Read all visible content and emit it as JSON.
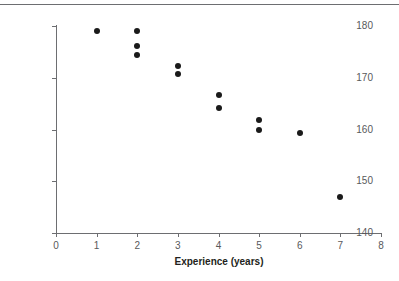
{
  "chart_data": {
    "type": "scatter",
    "title": "",
    "xlabel": "Experience (years)",
    "ylabel": "Preparation time (seconds)",
    "xlim": [
      0,
      8
    ],
    "ylim": [
      140,
      180
    ],
    "xticks": [
      "0",
      "1",
      "2",
      "3",
      "4",
      "5",
      "6",
      "7",
      "8"
    ],
    "xtick_values": [
      0,
      1,
      2,
      3,
      4,
      5,
      6,
      7,
      8
    ],
    "yticks": [
      "140",
      "150",
      "160",
      "170",
      "180"
    ],
    "ytick_values": [
      140,
      150,
      160,
      170,
      180
    ],
    "grid": false,
    "legend": null,
    "marker_color": "#1a1a1a",
    "axis_color": "#6d6e71",
    "points": [
      {
        "x": 1,
        "y": 179.0
      },
      {
        "x": 2,
        "y": 179.0
      },
      {
        "x": 2,
        "y": 176.2
      },
      {
        "x": 2,
        "y": 174.4
      },
      {
        "x": 3,
        "y": 172.2
      },
      {
        "x": 3,
        "y": 170.8
      },
      {
        "x": 4,
        "y": 166.6
      },
      {
        "x": 4,
        "y": 164.1
      },
      {
        "x": 5,
        "y": 161.8
      },
      {
        "x": 5,
        "y": 160.0
      },
      {
        "x": 6,
        "y": 159.3
      },
      {
        "x": 7,
        "y": 147.0
      }
    ]
  }
}
